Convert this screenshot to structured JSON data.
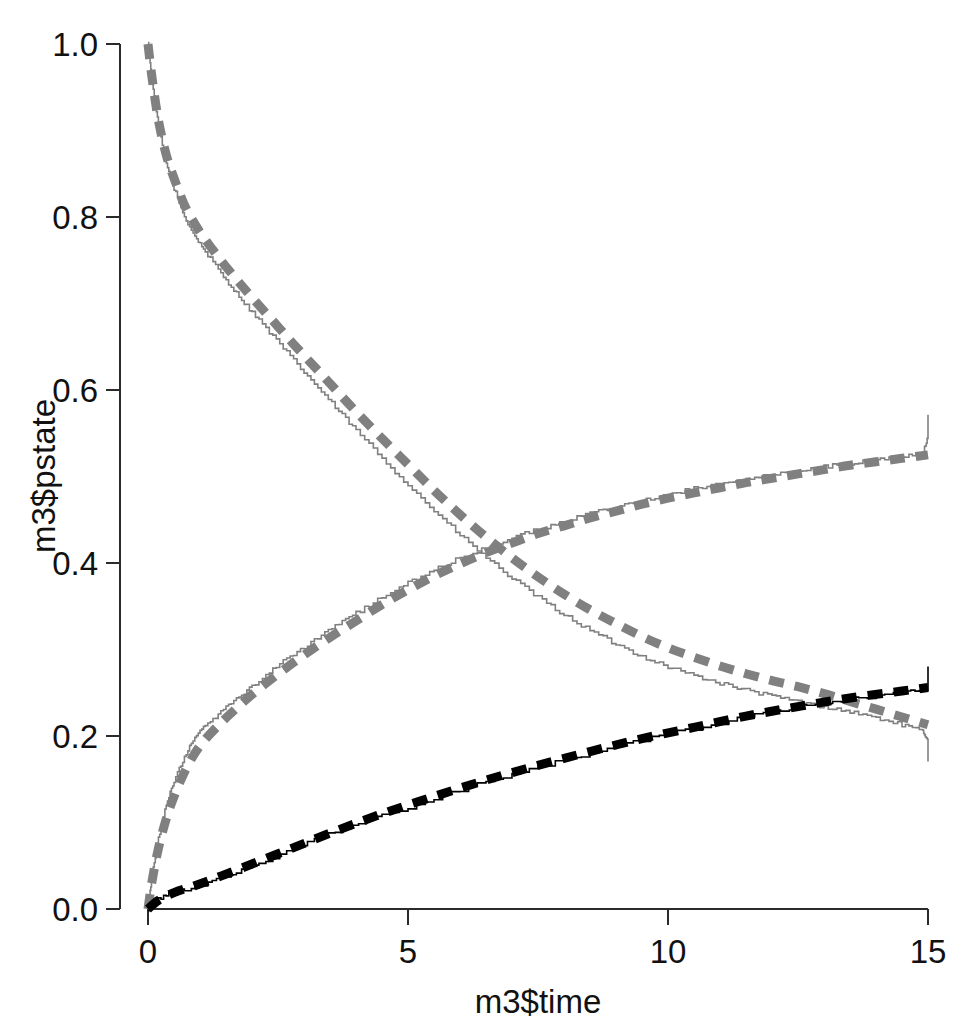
{
  "figure": {
    "width": 975,
    "height": 1027,
    "background": "#ffffff"
  },
  "axes": {
    "x_title": "m3$time",
    "y_title": "m3$pstate",
    "x_ticks": [
      "0",
      "5",
      "10",
      "15"
    ],
    "y_ticks": [
      "0.0",
      "0.2",
      "0.4",
      "0.6",
      "0.8",
      "1.0"
    ]
  },
  "colors": {
    "gray": "#808080",
    "black": "#000000",
    "axis": "#2b2b2b",
    "background": "#ffffff"
  },
  "chart_data": {
    "type": "line",
    "title": "",
    "subtitle": "",
    "xlabel": "m3$time",
    "ylabel": "m3$pstate",
    "xlim": [
      0,
      15
    ],
    "ylim": [
      0.0,
      1.0
    ],
    "xticks": [
      0,
      5,
      10,
      15
    ],
    "yticks": [
      0.0,
      0.2,
      0.4,
      0.6,
      0.8,
      1.0
    ],
    "grid": false,
    "legend": null,
    "annotations": [],
    "series": [
      {
        "name": "state-1-empirical",
        "style": "solid",
        "color": "#808080",
        "width": "thin",
        "x": [
          0.0,
          0.08,
          0.2,
          0.35,
          0.5,
          0.7,
          0.9,
          1.1,
          1.4,
          1.7,
          2.0,
          2.4,
          2.8,
          3.2,
          3.6,
          4.0,
          4.5,
          5.0,
          5.5,
          6.0,
          6.5,
          7.0,
          7.5,
          8.0,
          8.5,
          9.0,
          9.5,
          10.0,
          10.5,
          11.0,
          11.5,
          12.0,
          12.5,
          13.0,
          13.5,
          14.0,
          14.5,
          14.9,
          15.0
        ],
        "y": [
          1.0,
          0.955,
          0.905,
          0.862,
          0.833,
          0.8,
          0.778,
          0.76,
          0.735,
          0.712,
          0.69,
          0.662,
          0.634,
          0.607,
          0.58,
          0.553,
          0.521,
          0.49,
          0.46,
          0.432,
          0.406,
          0.382,
          0.36,
          0.34,
          0.322,
          0.306,
          0.292,
          0.28,
          0.27,
          0.261,
          0.253,
          0.246,
          0.24,
          0.234,
          0.228,
          0.221,
          0.213,
          0.205,
          0.196
        ]
      },
      {
        "name": "state-1-fitted",
        "style": "dashed",
        "color": "#808080",
        "width": "thick",
        "x": [
          0.0,
          0.08,
          0.2,
          0.35,
          0.5,
          0.7,
          0.9,
          1.1,
          1.4,
          1.7,
          2.0,
          2.4,
          2.8,
          3.2,
          3.6,
          4.0,
          4.5,
          5.0,
          5.5,
          6.0,
          6.5,
          7.0,
          7.5,
          8.0,
          8.5,
          9.0,
          9.5,
          10.0,
          10.5,
          11.0,
          11.5,
          12.0,
          12.5,
          13.0,
          13.5,
          14.0,
          14.5,
          15.0
        ],
        "y": [
          1.0,
          0.96,
          0.912,
          0.872,
          0.845,
          0.814,
          0.792,
          0.774,
          0.75,
          0.728,
          0.707,
          0.68,
          0.653,
          0.627,
          0.601,
          0.575,
          0.544,
          0.514,
          0.484,
          0.456,
          0.43,
          0.406,
          0.384,
          0.364,
          0.346,
          0.33,
          0.315,
          0.302,
          0.291,
          0.281,
          0.272,
          0.264,
          0.257,
          0.249,
          0.24,
          0.231,
          0.222,
          0.213
        ]
      },
      {
        "name": "state-2-empirical",
        "style": "solid",
        "color": "#808080",
        "width": "thin",
        "x": [
          0.0,
          0.08,
          0.2,
          0.35,
          0.5,
          0.7,
          0.9,
          1.1,
          1.4,
          1.7,
          2.0,
          2.4,
          2.8,
          3.2,
          3.6,
          4.0,
          4.5,
          5.0,
          5.5,
          6.0,
          6.5,
          7.0,
          7.5,
          8.0,
          8.5,
          9.0,
          9.5,
          10.0,
          10.5,
          11.0,
          11.5,
          12.0,
          12.5,
          13.0,
          13.5,
          14.0,
          14.5,
          14.9,
          15.0
        ],
        "y": [
          0.0,
          0.04,
          0.082,
          0.12,
          0.148,
          0.176,
          0.198,
          0.212,
          0.228,
          0.243,
          0.258,
          0.277,
          0.295,
          0.311,
          0.327,
          0.342,
          0.36,
          0.377,
          0.392,
          0.406,
          0.418,
          0.429,
          0.439,
          0.448,
          0.457,
          0.465,
          0.472,
          0.479,
          0.486,
          0.492,
          0.497,
          0.502,
          0.507,
          0.511,
          0.515,
          0.519,
          0.523,
          0.526,
          0.546
        ]
      },
      {
        "name": "state-2-fitted",
        "style": "dashed",
        "color": "#808080",
        "width": "thick",
        "x": [
          0.0,
          0.08,
          0.2,
          0.35,
          0.5,
          0.7,
          0.9,
          1.1,
          1.4,
          1.7,
          2.0,
          2.4,
          2.8,
          3.2,
          3.6,
          4.0,
          4.5,
          5.0,
          5.5,
          6.0,
          6.5,
          7.0,
          7.5,
          8.0,
          8.5,
          9.0,
          9.5,
          10.0,
          10.5,
          11.0,
          11.5,
          12.0,
          12.5,
          13.0,
          13.5,
          14.0,
          14.5,
          15.0
        ],
        "y": [
          0.0,
          0.033,
          0.07,
          0.104,
          0.13,
          0.158,
          0.18,
          0.196,
          0.215,
          0.232,
          0.248,
          0.267,
          0.285,
          0.302,
          0.318,
          0.333,
          0.352,
          0.369,
          0.385,
          0.399,
          0.412,
          0.423,
          0.434,
          0.443,
          0.452,
          0.46,
          0.468,
          0.475,
          0.481,
          0.487,
          0.493,
          0.498,
          0.503,
          0.508,
          0.513,
          0.517,
          0.521,
          0.525
        ]
      },
      {
        "name": "state-3-empirical",
        "style": "solid",
        "color": "#000000",
        "width": "thin",
        "x": [
          0.0,
          0.2,
          0.5,
          0.9,
          1.4,
          2.0,
          2.8,
          3.6,
          4.5,
          5.5,
          6.5,
          7.5,
          8.5,
          9.5,
          10.5,
          11.5,
          12.5,
          13.5,
          14.5,
          15.0
        ],
        "y": [
          0.0,
          0.012,
          0.02,
          0.025,
          0.036,
          0.05,
          0.07,
          0.089,
          0.108,
          0.128,
          0.147,
          0.164,
          0.18,
          0.195,
          0.209,
          0.222,
          0.234,
          0.243,
          0.251,
          0.255
        ]
      },
      {
        "name": "state-3-fitted",
        "style": "dashed",
        "color": "#000000",
        "width": "thick",
        "x": [
          0.0,
          0.2,
          0.5,
          0.9,
          1.4,
          2.0,
          2.8,
          3.6,
          4.5,
          5.5,
          6.5,
          7.5,
          8.5,
          9.5,
          10.5,
          11.5,
          12.5,
          13.5,
          14.5,
          15.0
        ],
        "y": [
          0.0,
          0.01,
          0.019,
          0.027,
          0.038,
          0.052,
          0.071,
          0.09,
          0.11,
          0.13,
          0.149,
          0.166,
          0.182,
          0.197,
          0.21,
          0.223,
          0.234,
          0.244,
          0.252,
          0.256
        ]
      }
    ]
  }
}
